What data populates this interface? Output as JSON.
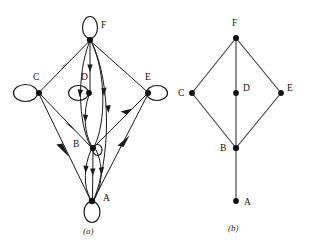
{
  "figure": {
    "panels": [
      {
        "id": "a",
        "caption": "(a)",
        "type": "directed-multigraph-with-loops",
        "vertices": [
          {
            "id": "F",
            "label": "F",
            "x": 90,
            "y": 40,
            "label_x": 101,
            "label_y": 28,
            "loop": "top"
          },
          {
            "id": "C",
            "label": "C",
            "x": 39,
            "y": 93,
            "label_x": 36,
            "label_y": 80,
            "loop": "left"
          },
          {
            "id": "D",
            "label": "D",
            "x": 90,
            "y": 93,
            "label_x": 84,
            "label_y": 80,
            "loop": "left"
          },
          {
            "id": "E",
            "label": "E",
            "x": 148,
            "y": 93,
            "label_x": 148,
            "label_y": 80,
            "loop": "right"
          },
          {
            "id": "B",
            "label": "B",
            "x": 93,
            "y": 148,
            "label_x": 76,
            "label_y": 147,
            "loop": "right"
          },
          {
            "id": "A",
            "label": "A",
            "x": 92,
            "y": 201,
            "label_x": 104,
            "label_y": 200,
            "loop": "bottom"
          }
        ],
        "edges": [
          {
            "from": "C",
            "to": "F",
            "kind": "straight"
          },
          {
            "from": "F",
            "to": "E",
            "kind": "straight"
          },
          {
            "from": "C",
            "to": "B",
            "kind": "straight"
          },
          {
            "from": "C",
            "to": "A",
            "kind": "straight"
          },
          {
            "from": "B",
            "to": "E",
            "kind": "straight"
          },
          {
            "from": "A",
            "to": "E",
            "kind": "straight"
          },
          {
            "from": "F",
            "to": "D",
            "kind": "straight"
          },
          {
            "from": "F",
            "to": "B",
            "kind": "curved-left"
          },
          {
            "from": "B",
            "to": "F",
            "kind": "curved-right"
          },
          {
            "from": "D",
            "to": "B",
            "kind": "curved-left"
          },
          {
            "from": "F",
            "to": "A",
            "kind": "curved-right"
          },
          {
            "from": "B",
            "to": "A",
            "kind": "straight"
          },
          {
            "from": "B",
            "to": "A",
            "kind": "curved-left"
          },
          {
            "from": "A",
            "to": "B",
            "kind": "curved-right"
          }
        ],
        "loops": [
          {
            "at": "F"
          },
          {
            "at": "C"
          },
          {
            "at": "D"
          },
          {
            "at": "E"
          },
          {
            "at": "B"
          },
          {
            "at": "A"
          }
        ]
      },
      {
        "id": "b",
        "caption": "(b)",
        "type": "undirected-simple-graph",
        "vertices": [
          {
            "id": "F",
            "label": "F",
            "x": 61,
            "y": 38,
            "label_x": 58,
            "label_y": 25
          },
          {
            "id": "C",
            "label": "C",
            "x": 17,
            "y": 93,
            "label_x": 4,
            "label_y": 96
          },
          {
            "id": "D",
            "label": "D",
            "x": 61,
            "y": 93,
            "label_x": 70,
            "label_y": 92
          },
          {
            "id": "E",
            "label": "E",
            "x": 106,
            "y": 93,
            "label_x": 112,
            "label_y": 92
          },
          {
            "id": "B",
            "label": "B",
            "x": 61,
            "y": 148,
            "label_x": 45,
            "label_y": 151
          },
          {
            "id": "A",
            "label": "A",
            "x": 61,
            "y": 201,
            "label_x": 70,
            "label_y": 204
          }
        ],
        "edges": [
          {
            "from": "F",
            "to": "C"
          },
          {
            "from": "F",
            "to": "E"
          },
          {
            "from": "F",
            "to": "D"
          },
          {
            "from": "D",
            "to": "B"
          },
          {
            "from": "C",
            "to": "B"
          },
          {
            "from": "E",
            "to": "B"
          },
          {
            "from": "B",
            "to": "A"
          }
        ]
      }
    ],
    "colors": {
      "ink": "#1a1a1a",
      "background": "#ffffff",
      "edge_b": "#3a3a3a"
    }
  }
}
